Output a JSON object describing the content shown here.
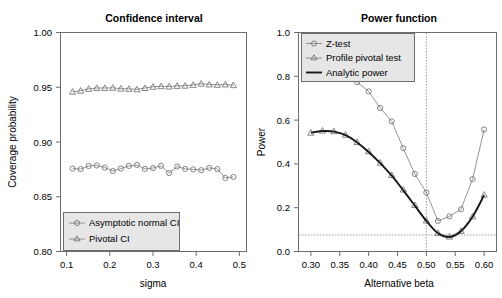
{
  "figure": {
    "width": 502,
    "height": 298,
    "background": "#ffffff",
    "panels": 2
  },
  "chart_data": [
    {
      "panel": "left",
      "type": "line",
      "title": "Confidence interval",
      "xlabel": "sigma",
      "ylabel": "Coverage probability",
      "xlim": [
        0.085,
        0.515
      ],
      "ylim": [
        0.795,
        1.005
      ],
      "xticks": [
        0.1,
        0.2,
        0.3,
        0.4,
        0.5
      ],
      "xticklabels": [
        "0.1",
        "0.2",
        "0.3",
        "0.4",
        "0.5"
      ],
      "yticks": [
        0.8,
        0.85,
        0.9,
        0.95,
        1.0
      ],
      "yticklabels": [
        "0.80",
        "0.85",
        "0.90",
        "0.95",
        "1.00"
      ],
      "grid": false,
      "legend_position": "lower left",
      "x": [
        0.1,
        0.12,
        0.14,
        0.16,
        0.18,
        0.2,
        0.22,
        0.24,
        0.26,
        0.28,
        0.3,
        0.32,
        0.34,
        0.36,
        0.38,
        0.4,
        0.42,
        0.44,
        0.46,
        0.48,
        0.5
      ],
      "series": [
        {
          "name": "Asymptotic normal CI",
          "marker": "circle",
          "line": "thin-grey",
          "values": [
            0.8745,
            0.874,
            0.877,
            0.8775,
            0.8755,
            0.8722,
            0.8745,
            0.877,
            0.878,
            0.8742,
            0.875,
            0.8772,
            0.8702,
            0.8765,
            0.8742,
            0.8738,
            0.873,
            0.8752,
            0.874,
            0.8655,
            0.8665
          ]
        },
        {
          "name": "Pivotal CI",
          "marker": "triangle",
          "line": "thin-grey",
          "values": [
            0.9482,
            0.9492,
            0.951,
            0.9518,
            0.9518,
            0.952,
            0.9512,
            0.951,
            0.9505,
            0.9518,
            0.953,
            0.9535,
            0.9532,
            0.9538,
            0.954,
            0.9548,
            0.956,
            0.9552,
            0.9548,
            0.9552,
            0.9545
          ]
        }
      ],
      "legend": [
        {
          "label": "Asymptotic normal CI",
          "marker": "circle"
        },
        {
          "label": "Pivotal CI",
          "marker": "triangle"
        }
      ]
    },
    {
      "panel": "right",
      "type": "line",
      "title": "Power function",
      "xlabel": "Alternative beta",
      "ylabel": "Power",
      "xlim": [
        0.295,
        0.605
      ],
      "ylim": [
        -0.03,
        1.03
      ],
      "xticks": [
        0.3,
        0.35,
        0.4,
        0.45,
        0.5,
        0.55,
        0.6
      ],
      "xticklabels": [
        "0.30",
        "0.35",
        "0.40",
        "0.45",
        "0.50",
        "0.55",
        "0.60"
      ],
      "yticks": [
        0.0,
        0.2,
        0.4,
        0.6,
        0.8,
        1.0
      ],
      "yticklabels": [
        "0.0",
        "0.2",
        "0.4",
        "0.6",
        "0.8",
        "1.0"
      ],
      "grid": false,
      "legend_position": "upper left",
      "reference_lines": [
        {
          "orientation": "vertical",
          "value": 0.5,
          "style": "dotted"
        },
        {
          "orientation": "horizontal",
          "value": 0.05,
          "style": "dotted"
        }
      ],
      "x": [
        0.3,
        0.32,
        0.34,
        0.36,
        0.38,
        0.4,
        0.42,
        0.44,
        0.46,
        0.48,
        0.5,
        0.52,
        0.54,
        0.56,
        0.58,
        0.6
      ],
      "series": [
        {
          "name": "Z-test",
          "marker": "circle",
          "line": "thin-grey",
          "values": [
            1.0,
            0.99,
            0.95,
            0.88,
            0.79,
            0.745,
            0.665,
            0.6,
            0.47,
            0.345,
            0.255,
            0.118,
            0.14,
            0.175,
            0.32,
            0.56
          ]
        },
        {
          "name": "Profile pivotal test",
          "marker": "triangle",
          "line": "thin-grey",
          "values": [
            0.545,
            0.555,
            0.552,
            0.535,
            0.5,
            0.455,
            0.4,
            0.34,
            0.27,
            0.195,
            0.12,
            0.06,
            0.042,
            0.07,
            0.14,
            0.245
          ]
        },
        {
          "name": "Analytic power",
          "marker": "none",
          "line": "thick-black",
          "values": [
            0.545,
            0.553,
            0.55,
            0.533,
            0.498,
            0.452,
            0.398,
            0.337,
            0.266,
            0.192,
            0.118,
            0.058,
            0.04,
            0.068,
            0.138,
            0.243
          ]
        }
      ],
      "legend": [
        {
          "label": "Z-test",
          "marker": "circle"
        },
        {
          "label": "Profile pivotal test",
          "marker": "triangle"
        },
        {
          "label": "Analytic power",
          "marker": "line"
        }
      ]
    }
  ],
  "left_panel": {
    "title": "Confidence interval",
    "xlabel": "sigma",
    "ylabel": "Coverage probability",
    "xticklabels": [
      "0.1",
      "0.2",
      "0.3",
      "0.4",
      "0.5"
    ],
    "yticklabels": [
      "0.80",
      "0.85",
      "0.90",
      "0.95",
      "1.00"
    ],
    "legend": {
      "item1": "Asymptotic normal CI",
      "item2": "Pivotal CI"
    }
  },
  "right_panel": {
    "title": "Power function",
    "xlabel": "Alternative beta",
    "ylabel": "Power",
    "xticklabels": [
      "0.30",
      "0.35",
      "0.40",
      "0.45",
      "0.50",
      "0.55",
      "0.60"
    ],
    "yticklabels": [
      "0.0",
      "0.2",
      "0.4",
      "0.6",
      "0.8",
      "1.0"
    ],
    "legend": {
      "item1": "Z-test",
      "item2": "Profile pivotal test",
      "item3": "Analytic power"
    }
  },
  "colors": {
    "axis": "#6d6d6d",
    "series_grey": "#7a7a7a",
    "series_black": "#1a1a1a",
    "legend_bg": "#e6e6e6",
    "text": "#000000"
  }
}
